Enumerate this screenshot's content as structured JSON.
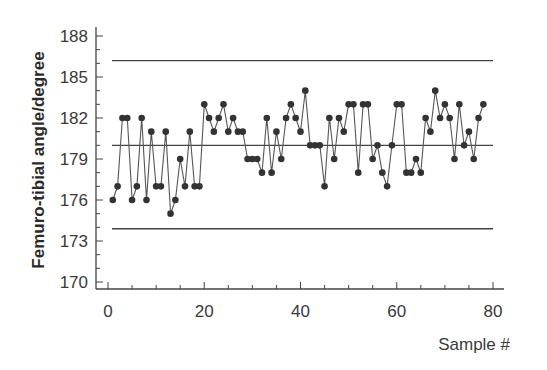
{
  "chart_data": {
    "type": "line",
    "title": "",
    "xlabel": "Sample #",
    "ylabel": "Femuro-tibial angle/degree",
    "xlim": [
      0,
      80
    ],
    "ylim": [
      170,
      188
    ],
    "x_ticks": [
      0,
      20,
      40,
      60,
      80
    ],
    "x_minor_step": 5,
    "y_ticks": [
      170,
      173,
      176,
      179,
      182,
      185,
      188
    ],
    "y_minor_step": 1,
    "grid": false,
    "legend": null,
    "reference_lines": [
      {
        "name": "upper control limit",
        "y": 186.2
      },
      {
        "name": "mean",
        "y": 180.0
      },
      {
        "name": "lower control limit",
        "y": 173.9
      }
    ],
    "series": [
      {
        "name": "Femuro-tibial angle",
        "marker": "circle",
        "color": "#333333",
        "x": [
          1,
          2,
          3,
          4,
          5,
          6,
          7,
          8,
          9,
          10,
          11,
          12,
          13,
          14,
          15,
          16,
          17,
          18,
          19,
          20,
          21,
          22,
          23,
          24,
          25,
          26,
          27,
          28,
          29,
          30,
          31,
          32,
          33,
          34,
          35,
          36,
          37,
          38,
          39,
          40,
          41,
          42,
          43,
          44,
          45,
          46,
          47,
          48,
          49,
          50,
          51,
          52,
          53,
          54,
          55,
          56,
          57,
          58,
          59,
          60,
          61,
          62,
          63,
          64,
          65,
          66,
          67,
          68,
          69,
          70,
          71,
          72,
          73,
          74,
          75,
          76,
          77,
          78
        ],
        "values": [
          176,
          177,
          182,
          182,
          176,
          177,
          182,
          176,
          181,
          177,
          177,
          181,
          175,
          176,
          179,
          177,
          181,
          177,
          177,
          183,
          182,
          181,
          182,
          183,
          181,
          182,
          181,
          181,
          179,
          179,
          179,
          178,
          182,
          178,
          181,
          179,
          182,
          183,
          182,
          181,
          184,
          180,
          180,
          180,
          177,
          182,
          179,
          182,
          181,
          183,
          183,
          178,
          183,
          183,
          179,
          180,
          178,
          177,
          180,
          183,
          183,
          178,
          178,
          179,
          178,
          182,
          181,
          184,
          182,
          183,
          182,
          179,
          183,
          180,
          181,
          179,
          182,
          183
        ]
      }
    ]
  }
}
